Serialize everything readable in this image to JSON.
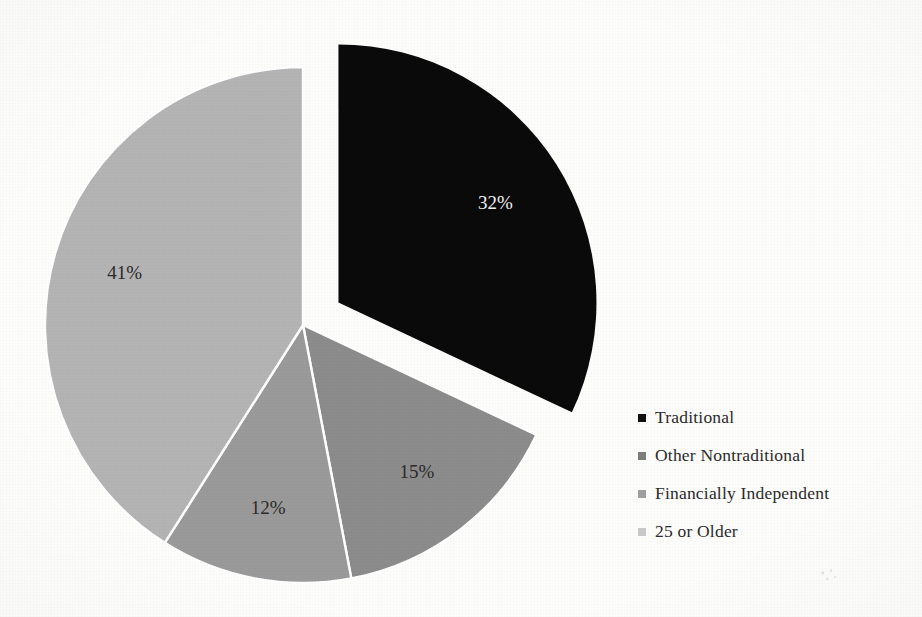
{
  "chart_data": {
    "type": "pie",
    "title": "",
    "categories": [
      "Traditional",
      "Other Nontraditional",
      "Financially Independent",
      "25 or Older"
    ],
    "values": [
      32,
      15,
      12,
      41
    ],
    "labels": [
      "32%",
      "15%",
      "12%",
      "41%"
    ],
    "unit": "percent",
    "legend_position": "right",
    "grid": false,
    "exploded_slices": [
      "Traditional"
    ],
    "colors": [
      "#0a0a0a",
      "#8c8c8c",
      "#9a9a9a",
      "#b4b4b4"
    ],
    "slice_border_color": "#ffffff",
    "background_color": "#fdfdfc",
    "slices": [
      {
        "name": "Traditional",
        "value": 32,
        "label": "32%",
        "color": "#0a0a0a",
        "start_angle": 0,
        "end_angle": 115.2,
        "exploded": true,
        "label_color": "#f2f2f2"
      },
      {
        "name": "Other Nontraditional",
        "value": 15,
        "label": "15%",
        "color": "#8c8c8c",
        "start_angle": 115.2,
        "end_angle": 169.2,
        "exploded": false,
        "label_color": "#2a2a2a"
      },
      {
        "name": "Financially Independent",
        "value": 12,
        "label": "12%",
        "color": "#9a9a9a",
        "start_angle": 169.2,
        "end_angle": 212.4,
        "exploded": false,
        "label_color": "#2a2a2a"
      },
      {
        "name": "25 or Older",
        "value": 41,
        "label": "41%",
        "color": "#b4b4b4",
        "start_angle": 212.4,
        "end_angle": 360,
        "exploded": false,
        "label_color": "#2a2a2a"
      }
    ]
  },
  "legend": {
    "items": [
      {
        "label": "Traditional",
        "swatch_color": "#111111"
      },
      {
        "label": "Other Nontraditional",
        "swatch_color": "#7d7d7d"
      },
      {
        "label": "Financially Independent",
        "swatch_color": "#a0a0a0"
      },
      {
        "label": "25 or Older",
        "swatch_color": "#c9c9c9"
      }
    ]
  }
}
